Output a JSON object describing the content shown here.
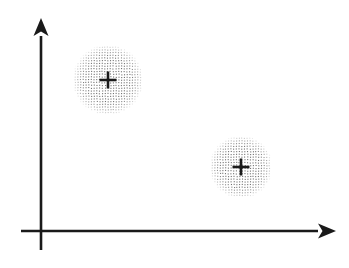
{
  "figure": {
    "background_color": "#ffffff",
    "width": 349,
    "height": 268
  },
  "axes": {
    "stroke_color": "#1a1a1a",
    "stroke_width": 2.6,
    "x_axis": {
      "label": "",
      "name": "x-axis",
      "y": 231,
      "x_start": 21,
      "x_end": 318,
      "arrow_tip_x": 336,
      "arrow_style": "barbed",
      "arrow_length": 18,
      "arrow_half_height": 7.5,
      "arrow_notch": 4.5
    },
    "y_axis": {
      "label": "",
      "name": "y-axis",
      "x": 41,
      "y_start": 250,
      "y_end": 36,
      "arrow_tip_y": 18,
      "arrow_style": "barbed",
      "arrow_length": 18,
      "arrow_half_height": 7.5,
      "arrow_notch": 4.5
    },
    "origin": {
      "x": 41,
      "y": 231
    }
  },
  "chart_data": {
    "type": "scatter",
    "title": "",
    "xlabel": "",
    "ylabel": "",
    "grid": false,
    "legend": "none",
    "xlim": [
      41,
      336
    ],
    "ylim": [
      18,
      231
    ],
    "clusters": [
      {
        "name": "cluster-1",
        "label": "",
        "center_x": 108,
        "center_y": 80,
        "radius": 35,
        "marker": "plus",
        "marker_size": 17,
        "marker_stroke_width": 2.6,
        "marker_color": "#1a1a1a",
        "fill_style": "stipple",
        "dot_color": "#6f6f6f",
        "dot_spacing": 2.7,
        "dot_radius": 0.55
      },
      {
        "name": "cluster-2",
        "label": "",
        "center_x": 241,
        "center_y": 167,
        "radius": 31,
        "marker": "plus",
        "marker_size": 17,
        "marker_stroke_width": 2.6,
        "marker_color": "#1a1a1a",
        "fill_style": "stipple",
        "dot_color": "#6f6f6f",
        "dot_spacing": 2.7,
        "dot_radius": 0.55
      }
    ]
  }
}
